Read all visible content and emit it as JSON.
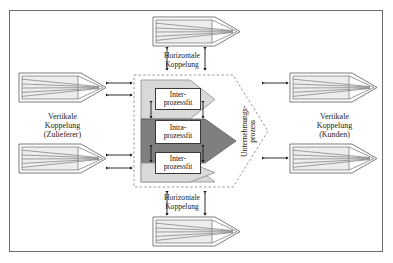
{
  "figure": {
    "background": "#ffffff",
    "frame_color": "#6d6d6d"
  },
  "colors": {
    "light_gray_arrow": "#d9d9d9",
    "dark_gray_arrow": "#7f7f7f",
    "pale_arrow_fill": "#f2f2f2",
    "stripe_line": "#7a7a7a",
    "outline": "#4a4a4a",
    "dashed_boundary": "#8a8a8a",
    "text": "#111111"
  },
  "labels": {
    "top_horizontal": "Horizontale\nKoppelung",
    "bottom_horizontal": "Horizontale\nKoppelung",
    "left_vertical": "Vertikale\nKoppelung\n(Zulieferer)",
    "right_vertical": "Vertikale\nKoppelung\n(Kunden)",
    "enterprise_process": "Unternehmungs-\nprozess"
  },
  "fit_boxes": [
    {
      "id": "inter-top",
      "text": "Inter-\nprozessfit"
    },
    {
      "id": "intra-middle",
      "text": "Intra-\nprozessfit"
    },
    {
      "id": "inter-bottom",
      "text": "Inter-\nprozessfit"
    }
  ],
  "process_arrows": {
    "supplier_top": {
      "name": "supplier-process-top",
      "stripes": 4
    },
    "supplier_bottom": {
      "name": "supplier-process-bottom",
      "stripes": 4
    },
    "customer_top": {
      "name": "customer-process-top",
      "stripes": 4
    },
    "customer_bottom": {
      "name": "customer-process-bottom",
      "stripes": 4
    },
    "partner_top": {
      "name": "partner-process-top",
      "stripes": 4
    },
    "partner_bottom": {
      "name": "partner-process-bottom",
      "stripes": 4
    }
  },
  "internal_arrows": {
    "inter_top": {
      "name": "inter-process-arrow-top",
      "fill": "#d9d9d9"
    },
    "intra_middle": {
      "name": "intra-process-arrow-middle",
      "fill": "#7f7f7f"
    },
    "inter_bottom": {
      "name": "inter-process-arrow-bottom",
      "fill": "#d9d9d9"
    }
  },
  "connectors": {
    "count_double_headed": 14,
    "style": "double-headed"
  }
}
